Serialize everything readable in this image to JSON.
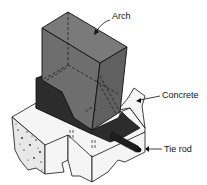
{
  "diagram": {
    "type": "isometric-cutaway",
    "labels": {
      "arch": "Arch",
      "concrete": "Concrete",
      "tie_rod": "Tie rod"
    },
    "colors": {
      "arch": "#6e6e6e",
      "arch_side": "#5a5a5a",
      "skewback": "#2a2a2a",
      "foundation": "#f4f4f4",
      "line": "#111111"
    }
  }
}
